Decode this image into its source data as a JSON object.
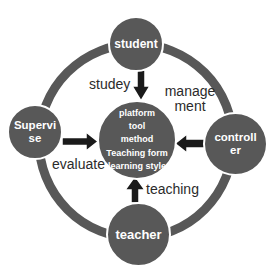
{
  "colors": {
    "node_fill": "#585858",
    "ring": "#585858",
    "arrow": "#1a1a1a",
    "edge_label_text": "#2b2b2b",
    "node_text": "#ffffff",
    "background": "#ffffff"
  },
  "nodes": {
    "student": {
      "label": "student"
    },
    "supervise": {
      "lines": [
        "Supervi",
        "se"
      ]
    },
    "controller": {
      "lines": [
        "controll",
        "er"
      ]
    },
    "teacher": {
      "label": "teacher"
    },
    "center": {
      "lines": [
        "platform",
        "tool",
        "method",
        "Teaching form",
        "learning style"
      ]
    }
  },
  "edge_labels": {
    "study": "studey",
    "management": {
      "lines": [
        "manage",
        "ment"
      ]
    },
    "evaluate": "evaluate",
    "teaching": "teaching"
  }
}
